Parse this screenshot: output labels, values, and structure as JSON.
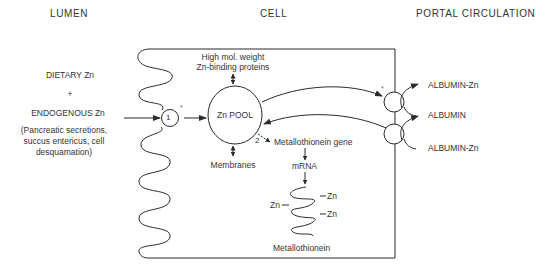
{
  "headers": {
    "lumen": "LUMEN",
    "cell": "CELL",
    "portal": "PORTAL  CIRCULATION"
  },
  "lumen": {
    "dietary": "DIETARY Zn",
    "plus": "+",
    "endogenous": "ENDOGENOUS Zn",
    "sources_line1": "(Pancreatic secretions,",
    "sources_line2": "succus entericus, cell",
    "sources_line3": "desquamation)"
  },
  "cell": {
    "carrier1": "1",
    "asterisk": "*",
    "pool": "Zn POOL",
    "high_mol_line1": "High mol. weight",
    "high_mol_line2": "Zn-binding proteins",
    "membranes": "Membranes",
    "step2": "2",
    "mt_gene": "Metallothionein  gene",
    "mrna": "mRNA",
    "zn_left": "Zn",
    "zn_right1": "Zn",
    "zn_right2": "Zn",
    "metallothionein": "Metallothionein"
  },
  "portal": {
    "asterisk": "*",
    "albumin_zn_top": "ALBUMIN-Zn",
    "albumin": "ALBUMIN",
    "albumin_zn_bottom": "ALBUMIN-Zn"
  },
  "colors": {
    "line": "#2a2a2a",
    "text": "#333333",
    "background": "#ffffff"
  }
}
